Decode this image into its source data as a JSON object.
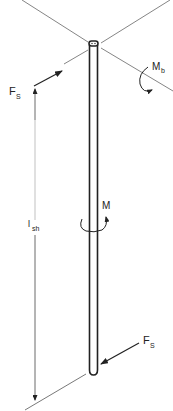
{
  "diagram": {
    "labels": {
      "force_top": {
        "main": "F",
        "sub": "S"
      },
      "force_bottom": {
        "main": "F",
        "sub": "S"
      },
      "bending_moment": {
        "main": "M",
        "sub": "b"
      },
      "torsion_moment": {
        "main": "M"
      },
      "shaft_length": {
        "main": "l",
        "sub": "sh"
      }
    },
    "colors": {
      "stroke": "#222222",
      "thin_line": "#555555",
      "background": "#ffffff"
    }
  }
}
